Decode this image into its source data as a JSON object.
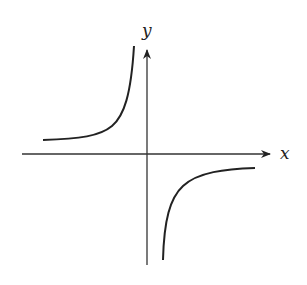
{
  "diagram": {
    "title": "",
    "axes": {
      "x_label": "x",
      "y_label": "y"
    },
    "colors": {
      "stroke": "#222222",
      "background": "#ffffff"
    },
    "curves": [
      {
        "name": "upper-left-branch",
        "quadrant": "II"
      },
      {
        "name": "lower-right-branch",
        "quadrant": "IV"
      }
    ]
  }
}
